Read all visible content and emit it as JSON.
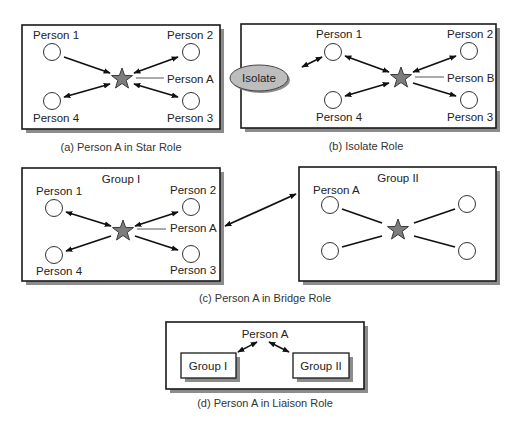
{
  "figure": {
    "panels": [
      {
        "id": "a",
        "caption": "(a) Person A in Star Role",
        "labels": {
          "p1": "Person 1",
          "p2": "Person 2",
          "p3": "Person 3",
          "p4": "Person 4",
          "center": "Person A"
        },
        "edges": [
          {
            "from": "Person 1",
            "to": "Person A",
            "direction": "one-way"
          },
          {
            "from": "Person 2",
            "to": "Person A",
            "direction": "two-way"
          },
          {
            "from": "Person 3",
            "to": "Person A",
            "direction": "two-way"
          },
          {
            "from": "Person 4",
            "to": "Person A",
            "direction": "two-way"
          }
        ]
      },
      {
        "id": "b",
        "caption": "(b) Isolate Role",
        "labels": {
          "p1": "Person 1",
          "p2": "Person 2",
          "p3": "Person 3",
          "p4": "Person 4",
          "center": "Person B",
          "isolate": "Isolate"
        },
        "edges": [
          {
            "from": "Isolate",
            "to": "Person 1",
            "direction": "two-way"
          },
          {
            "from": "Person 1",
            "to": "Person B",
            "direction": "two-way"
          },
          {
            "from": "Person 2",
            "to": "Person B",
            "direction": "two-way"
          },
          {
            "from": "Person 4",
            "to": "Person B",
            "direction": "two-way"
          },
          {
            "from": "Person B",
            "to": "Person 3",
            "direction": "one-way"
          }
        ]
      },
      {
        "id": "c",
        "caption": "(c) Person A in Bridge Role",
        "group1": {
          "title": "Group I",
          "labels": {
            "p1": "Person 1",
            "p2": "Person 2",
            "p3": "Person 3",
            "p4": "Person 4",
            "center": "Person A"
          }
        },
        "group2": {
          "title": "Group II",
          "labels": {
            "p1": "Person A"
          }
        },
        "edges": [
          {
            "from": "Group I",
            "to": "Group II",
            "direction": "two-way"
          }
        ]
      },
      {
        "id": "d",
        "caption": "(d) Person A in Liaison Role",
        "labels": {
          "center": "Person A",
          "g1": "Group I",
          "g2": "Group II"
        },
        "edges": [
          {
            "from": "Person A",
            "to": "Group I",
            "direction": "two-way"
          },
          {
            "from": "Person A",
            "to": "Group II",
            "direction": "two-way"
          }
        ]
      }
    ]
  },
  "colors": {
    "star_fill": "#7d7d7d",
    "isolate_fill": "#bdbdbd",
    "shadow": "#8c8c8c",
    "line": "#111111"
  }
}
